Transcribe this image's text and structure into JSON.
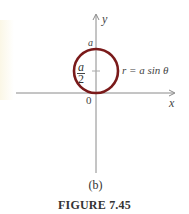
{
  "figure": {
    "caption": "FIGURE 7.45",
    "sublabel": "(b)",
    "axes": {
      "x_label": "x",
      "y_label": "y",
      "origin_label": "0"
    },
    "circle": {
      "equation": "r = a sin θ",
      "top_label": "a",
      "center_label_num": "a",
      "center_label_den": "2",
      "stroke_color": "#7a1a1a"
    },
    "axis_color": "#8a8a8a"
  }
}
